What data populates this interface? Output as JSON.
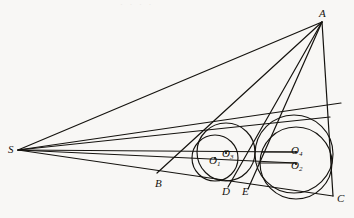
{
  "figure": {
    "kind": "euclidean-geometry-diagram",
    "background_color": "#f8f7f5",
    "ink_color": "#15130f",
    "width": 354,
    "height": 218
  },
  "points": [
    {
      "id": "A",
      "label": "A",
      "sub": "",
      "x": 322,
      "y": 22,
      "label_x": 319,
      "label_y": 8
    },
    {
      "id": "C",
      "label": "C",
      "sub": "",
      "x": 333,
      "y": 196,
      "label_x": 337,
      "label_y": 193
    },
    {
      "id": "S",
      "label": "S",
      "sub": "",
      "x": 18,
      "y": 150,
      "label_x": 8,
      "label_y": 144
    },
    {
      "id": "B",
      "label": "B",
      "sub": "",
      "x": 161,
      "y": 175,
      "label_x": 155,
      "label_y": 178
    },
    {
      "id": "D",
      "label": "D",
      "sub": "",
      "x": 228,
      "y": 186,
      "label_x": 222,
      "label_y": 186
    },
    {
      "id": "E",
      "label": "E",
      "sub": "",
      "x": 248,
      "y": 188,
      "label_x": 242,
      "label_y": 186
    },
    {
      "id": "O1",
      "label": "O",
      "sub": "1",
      "x": 215,
      "y": 158,
      "label_x": 209,
      "label_y": 155
    },
    {
      "id": "O2",
      "label": "O",
      "sub": "2",
      "x": 296,
      "y": 164,
      "label_x": 291,
      "label_y": 160
    },
    {
      "id": "O3",
      "label": "O",
      "sub": "3",
      "x": 226,
      "y": 153,
      "label_x": 222,
      "label_y": 148
    },
    {
      "id": "O4",
      "label": "O",
      "sub": "4",
      "x": 296,
      "y": 152,
      "label_x": 291,
      "label_y": 145
    }
  ],
  "circles": [
    {
      "id": "circle-O1",
      "center": "O1",
      "cx": 215,
      "cy": 158,
      "r": 23
    },
    {
      "id": "circle-O3",
      "center": "O3",
      "cx": 226,
      "cy": 152,
      "r": 29
    },
    {
      "id": "circle-O2",
      "center": "O2",
      "cx": 296,
      "cy": 163,
      "r": 36
    },
    {
      "id": "circle-O4",
      "center": "O4",
      "cx": 294,
      "cy": 154,
      "r": 39
    }
  ],
  "segments": [
    {
      "id": "seg-S-A",
      "from": "S",
      "to": "A",
      "x1": 18,
      "y1": 150,
      "x2": 322,
      "y2": 22,
      "note": "ray S to apex A"
    },
    {
      "id": "seg-S-C",
      "from": "S",
      "to": "C",
      "x1": 18,
      "y1": 150,
      "x2": 333,
      "y2": 196,
      "note": "lower base line through B, D, E to C"
    },
    {
      "id": "seg-A-C",
      "from": "A",
      "to": "C",
      "x1": 322,
      "y1": 22,
      "x2": 333,
      "y2": 196,
      "note": "right side of triangle"
    },
    {
      "id": "seg-A-B",
      "from": "A",
      "to": "B",
      "x1": 322,
      "y1": 22,
      "x2": 157,
      "y2": 173,
      "note": "cevian from A to B"
    },
    {
      "id": "seg-A-D",
      "from": "A",
      "to": "D",
      "x1": 322,
      "y1": 22,
      "x2": 228,
      "y2": 187,
      "note": "cevian from A to D"
    },
    {
      "id": "seg-A-E",
      "from": "A",
      "to": "E",
      "x1": 322,
      "y1": 22,
      "x2": 248,
      "y2": 189,
      "note": "cevian from A to E"
    },
    {
      "id": "seg-S-T1",
      "from": "S",
      "to": "T1",
      "x1": 18,
      "y1": 150,
      "x2": 341,
      "y2": 103,
      "note": "upper tangent ray from S"
    },
    {
      "id": "seg-S-T2",
      "from": "S",
      "to": "T2",
      "x1": 18,
      "y1": 150,
      "x2": 330,
      "y2": 117,
      "note": "second tangent ray from S"
    },
    {
      "id": "seg-S-X",
      "from": "S",
      "to": "X",
      "x1": 18,
      "y1": 150,
      "x2": 296,
      "y2": 152,
      "note": "axis ray S through centers O3 and O4"
    },
    {
      "id": "seg-S-Y",
      "from": "S",
      "to": "Y",
      "x1": 18,
      "y1": 150,
      "x2": 296,
      "y2": 163,
      "note": "axis ray S through centers O1 and O2"
    },
    {
      "id": "seg-rad-O4",
      "from": "O4",
      "to": "R4",
      "x1": 296,
      "y1": 152,
      "x2": 262,
      "y2": 152,
      "note": "radius tick at O4"
    },
    {
      "id": "seg-rad-O2",
      "from": "O2",
      "to": "R2",
      "x1": 296,
      "y1": 163,
      "x2": 258,
      "y2": 163,
      "note": "radius tick at O2"
    }
  ],
  "artifacts": {
    "top_smudge": "· · · ·"
  }
}
